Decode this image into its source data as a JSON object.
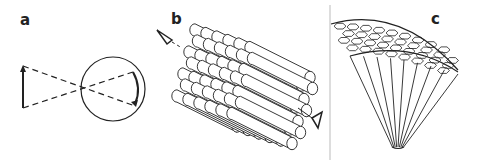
{
  "figure": {
    "panels": [
      {
        "label": "a",
        "description": "object arrow imaged through spherical lens (inverted image)"
      },
      {
        "label": "b",
        "description": "hexagonal bundle of cylindrical rods with viewing eyes"
      },
      {
        "label": "c",
        "description": "compound eye section with hexagonal facets and radiating ommatidia"
      }
    ]
  },
  "colors": {
    "ink": "#222222",
    "background": "#ffffff",
    "divider": "#bbbbbb"
  }
}
